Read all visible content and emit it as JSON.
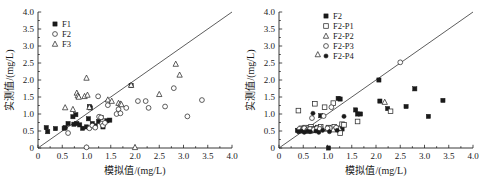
{
  "figure": {
    "background_color": "#ffffff",
    "axis_color": "#222222",
    "marker_color": "#1a1a1a"
  },
  "chart_data": [
    {
      "type": "scatter",
      "panel": "left",
      "title": "",
      "xlabel": "模拟值/(mg/L)",
      "ylabel": "实测值/(mg/L)",
      "xlim": [
        0,
        4.0
      ],
      "ylim": [
        0,
        4.0
      ],
      "xticks": [
        "0",
        "0.5",
        "1.0",
        "1.5",
        "2.0",
        "2.5",
        "3.0",
        "3.5",
        "4.0"
      ],
      "yticks": [
        "0",
        "0.5",
        "1.0",
        "1.5",
        "2.0",
        "2.5",
        "3.0",
        "3.5",
        "4.0"
      ],
      "xtick_values": [
        0,
        0.5,
        1.0,
        1.5,
        2.0,
        2.5,
        3.0,
        3.5,
        4.0
      ],
      "ytick_values": [
        0,
        0.5,
        1.0,
        1.5,
        2.0,
        2.5,
        3.0,
        3.5,
        4.0
      ],
      "grid": false,
      "legend_position": "upper-left",
      "reference_line": {
        "name": "1:1 identity line",
        "from": [
          0,
          0
        ],
        "to": [
          4.0,
          4.0
        ]
      },
      "series": [
        {
          "name": "F1",
          "marker": "filled-square",
          "points": [
            [
              0.17,
              0.6
            ],
            [
              0.2,
              0.48
            ],
            [
              0.36,
              0.57
            ],
            [
              0.54,
              0.58
            ],
            [
              0.56,
              0.6
            ],
            [
              0.62,
              0.72
            ],
            [
              0.72,
              0.92
            ],
            [
              0.74,
              0.7
            ],
            [
              0.78,
              0.98
            ],
            [
              0.8,
              0.72
            ],
            [
              0.86,
              0.68
            ],
            [
              0.92,
              0.58
            ],
            [
              1.0,
              0.62
            ],
            [
              1.04,
              0.86
            ],
            [
              1.06,
              1.22
            ],
            [
              1.08,
              1.18
            ],
            [
              1.12,
              0.72
            ],
            [
              1.18,
              0.65
            ],
            [
              1.25,
              0.78
            ],
            [
              1.3,
              0.9
            ],
            [
              1.34,
              0.62
            ],
            [
              1.42,
              0.8
            ],
            [
              1.48,
              0.82
            ],
            [
              1.92,
              1.84
            ]
          ]
        },
        {
          "name": "F2",
          "marker": "open-circle",
          "points": [
            [
              0.62,
              0.44
            ],
            [
              1.0,
              0.02
            ],
            [
              1.06,
              0.58
            ],
            [
              1.12,
              0.66
            ],
            [
              1.18,
              0.6
            ],
            [
              1.24,
              1.52
            ],
            [
              1.26,
              0.92
            ],
            [
              1.3,
              0.9
            ],
            [
              1.32,
              0.72
            ],
            [
              1.34,
              0.66
            ],
            [
              1.38,
              0.74
            ],
            [
              1.44,
              1.26
            ],
            [
              1.62,
              1.0
            ],
            [
              1.66,
              1.14
            ],
            [
              1.7,
              1.02
            ],
            [
              1.82,
              1.18
            ],
            [
              2.06,
              1.38
            ],
            [
              2.22,
              1.38
            ],
            [
              2.28,
              1.18
            ],
            [
              2.62,
              1.22
            ],
            [
              2.8,
              1.76
            ],
            [
              3.08,
              0.93
            ],
            [
              3.38,
              1.41
            ]
          ]
        },
        {
          "name": "F3",
          "marker": "open-triangle",
          "points": [
            [
              0.56,
              1.19
            ],
            [
              0.72,
              1.14
            ],
            [
              0.8,
              1.62
            ],
            [
              0.82,
              1.54
            ],
            [
              0.84,
              1.5
            ],
            [
              0.96,
              1.52
            ],
            [
              1.0,
              2.06
            ],
            [
              1.02,
              1.56
            ],
            [
              1.06,
              1.2
            ],
            [
              1.44,
              1.42
            ],
            [
              1.52,
              1.38
            ],
            [
              1.66,
              1.32
            ],
            [
              1.7,
              1.3
            ],
            [
              1.72,
              1.28
            ],
            [
              1.92,
              1.85
            ],
            [
              2.0,
              0.02
            ],
            [
              2.5,
              1.58
            ],
            [
              2.84,
              2.47
            ],
            [
              2.92,
              2.15
            ]
          ]
        }
      ]
    },
    {
      "type": "scatter",
      "panel": "right",
      "title": "",
      "xlabel": "模拟值/(mg/L)",
      "ylabel": "实测值/(mg/L)",
      "xlim": [
        0,
        4.0
      ],
      "ylim": [
        0,
        4.0
      ],
      "xticks": [
        "0",
        "0.5",
        "1.0",
        "1.5",
        "2.0",
        "2.5",
        "3.0",
        "3.5",
        "4.0"
      ],
      "yticks": [
        "0",
        "0.5",
        "1.0",
        "1.5",
        "2.0",
        "2.5",
        "3.0",
        "3.5",
        "4.0"
      ],
      "xtick_values": [
        0,
        0.5,
        1.0,
        1.5,
        2.0,
        2.5,
        3.0,
        3.5,
        4.0
      ],
      "ytick_values": [
        0,
        0.5,
        1.0,
        1.5,
        2.0,
        2.5,
        3.0,
        3.5,
        4.0
      ],
      "grid": false,
      "legend_position": "upper-center",
      "reference_line": {
        "name": "1:1 identity line",
        "from": [
          0,
          0
        ],
        "to": [
          4.0,
          4.0
        ]
      },
      "series": [
        {
          "name": "F2",
          "marker": "filled-square",
          "points": [
            [
              0.38,
              0.52
            ],
            [
              0.42,
              0.5
            ],
            [
              0.46,
              0.54
            ],
            [
              0.5,
              0.52
            ],
            [
              0.54,
              0.5
            ],
            [
              0.58,
              0.56
            ],
            [
              0.62,
              0.54
            ],
            [
              0.66,
              0.5
            ],
            [
              0.7,
              0.56
            ],
            [
              0.74,
              0.52
            ],
            [
              0.78,
              0.58
            ],
            [
              0.86,
              0.95
            ],
            [
              1.02,
              0.0
            ],
            [
              1.22,
              1.46
            ],
            [
              1.26,
              1.44
            ],
            [
              1.3,
              0.56
            ],
            [
              1.58,
              1.12
            ],
            [
              1.62,
              1.0
            ],
            [
              1.68,
              1.0
            ],
            [
              2.06,
              2.0
            ],
            [
              2.08,
              1.38
            ],
            [
              2.24,
              1.16
            ],
            [
              2.62,
              1.22
            ],
            [
              2.8,
              1.74
            ],
            [
              3.08,
              0.93
            ],
            [
              3.38,
              1.4
            ]
          ]
        },
        {
          "name": "F2-P1",
          "marker": "open-square",
          "points": [
            [
              0.4,
              1.1
            ],
            [
              0.46,
              0.58
            ],
            [
              0.5,
              0.56
            ],
            [
              0.54,
              0.6
            ],
            [
              0.58,
              0.54
            ],
            [
              0.62,
              0.58
            ],
            [
              0.66,
              0.62
            ],
            [
              0.7,
              0.56
            ],
            [
              0.74,
              1.3
            ],
            [
              0.8,
              0.6
            ],
            [
              0.86,
              0.62
            ],
            [
              0.94,
              1.2
            ],
            [
              1.02,
              0.6
            ],
            [
              1.06,
              0.58
            ],
            [
              1.12,
              1.32
            ],
            [
              1.14,
              0.62
            ],
            [
              1.2,
              0.56
            ],
            [
              1.26,
              0.44
            ],
            [
              1.3,
              0.7
            ],
            [
              1.34,
              0.68
            ],
            [
              1.62,
              0.78
            ],
            [
              2.3,
              1.08
            ]
          ]
        },
        {
          "name": "F2-P2",
          "marker": "open-triangle",
          "points": [
            [
              0.44,
              0.52
            ],
            [
              0.5,
              0.54
            ],
            [
              0.56,
              0.5
            ],
            [
              0.62,
              0.56
            ],
            [
              0.68,
              0.52
            ],
            [
              0.74,
              0.54
            ],
            [
              0.8,
              2.75
            ],
            [
              0.88,
              0.58
            ],
            [
              1.0,
              0.56
            ],
            [
              1.12,
              0.54
            ],
            [
              1.24,
              0.58
            ],
            [
              2.18,
              1.35
            ]
          ]
        },
        {
          "name": "F2-P3",
          "marker": "open-circle",
          "points": [
            [
              0.42,
              0.56
            ],
            [
              0.48,
              0.52
            ],
            [
              0.52,
              0.58
            ],
            [
              0.58,
              0.52
            ],
            [
              0.64,
              0.56
            ],
            [
              0.68,
              0.88
            ],
            [
              0.72,
              0.54
            ],
            [
              0.78,
              0.58
            ],
            [
              0.84,
              0.56
            ],
            [
              0.92,
              0.94
            ],
            [
              1.0,
              0.58
            ],
            [
              1.08,
              1.2
            ],
            [
              1.18,
              0.6
            ],
            [
              2.5,
              2.52
            ]
          ]
        },
        {
          "name": "F2-P4",
          "marker": "filled-circle",
          "points": [
            [
              0.4,
              0.48
            ],
            [
              0.46,
              0.5
            ],
            [
              0.52,
              0.46
            ],
            [
              0.58,
              0.5
            ],
            [
              0.64,
              0.48
            ],
            [
              0.7,
              1.02
            ],
            [
              0.76,
              0.5
            ],
            [
              0.82,
              0.46
            ],
            [
              0.9,
              0.52
            ],
            [
              1.04,
              0.48
            ],
            [
              1.2,
              0.52
            ],
            [
              1.34,
              0.93
            ]
          ]
        }
      ]
    }
  ]
}
